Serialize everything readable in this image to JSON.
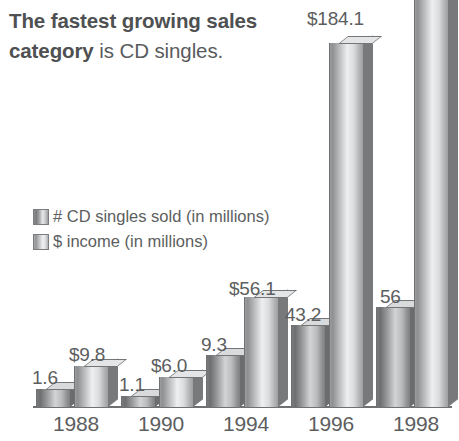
{
  "headline": {
    "strong": "The fastest growing sales category",
    "normal": " is CD singles."
  },
  "legend": {
    "items": [
      {
        "label": "# CD singles sold (in millions)",
        "swatch": "series-a"
      },
      {
        "label": "$ income (in millions)",
        "swatch": "series-b"
      }
    ]
  },
  "chart_data": {
    "type": "bar",
    "title": "The fastest growing sales category is CD singles.",
    "xlabel": "",
    "ylabel": "",
    "grid": false,
    "legend_position": "upper-left",
    "note": "1998 $ income bar is clipped at the top of the image and carries no printed value label.",
    "categories": [
      "1988",
      "1990",
      "1994",
      "1996",
      "1998"
    ],
    "series": [
      {
        "name": "# CD singles sold (in millions)",
        "key": "series-a",
        "values": [
          1.6,
          1.1,
          9.3,
          43.2,
          56
        ],
        "labels": [
          "1.6",
          "1.1",
          "9.3",
          "43.2",
          "56"
        ]
      },
      {
        "name": "$ income (in millions)",
        "key": "series-b",
        "values": [
          9.8,
          6.0,
          56.1,
          184.1,
          null
        ],
        "labels": [
          "$9.8",
          "$6.0",
          "$56.1",
          "$184.1",
          ""
        ]
      }
    ]
  },
  "colors": {
    "text": "#5c5e60",
    "axis": "#6e7072",
    "bar_dark": "#6d6f71",
    "bar_light": "#eeeff0",
    "background": "#ffffff"
  },
  "bars": [
    {
      "name": "bar-1988-singles",
      "series": "series-a",
      "left": 36,
      "width": 34,
      "height": 18,
      "label": "1.6",
      "label_left": 32,
      "label_top": 367
    },
    {
      "name": "bar-1988-income",
      "series": "series-b",
      "left": 74,
      "width": 34,
      "height": 41,
      "label": "$9.8",
      "label_left": 69,
      "label_top": 344
    },
    {
      "name": "bar-1990-singles",
      "series": "series-a",
      "left": 121,
      "width": 34,
      "height": 11,
      "label": "1.1",
      "label_left": 119,
      "label_top": 374
    },
    {
      "name": "bar-1990-income",
      "series": "series-b",
      "left": 159,
      "width": 34,
      "height": 30,
      "label": "$6.0",
      "label_left": 151,
      "label_top": 355
    },
    {
      "name": "bar-1994-singles",
      "series": "series-a",
      "left": 206,
      "width": 34,
      "height": 52,
      "label": "9.3",
      "label_left": 201,
      "label_top": 334
    },
    {
      "name": "bar-1994-income",
      "series": "series-b",
      "left": 244,
      "width": 34,
      "height": 110,
      "label": "$56.1",
      "label_left": 229,
      "label_top": 278
    },
    {
      "name": "bar-1996-singles",
      "series": "series-a",
      "left": 291,
      "width": 34,
      "height": 82,
      "label": "43.2",
      "label_left": 285,
      "label_top": 304
    },
    {
      "name": "bar-1996-income",
      "series": "series-b",
      "left": 329,
      "width": 34,
      "height": 364,
      "label": "$184.1",
      "label_left": 307,
      "label_top": 8
    },
    {
      "name": "bar-1998-singles",
      "series": "series-a",
      "left": 376,
      "width": 34,
      "height": 100,
      "label": "56",
      "label_left": 380,
      "label_top": 286
    },
    {
      "name": "bar-1998-income",
      "series": "series-b",
      "left": 414,
      "width": 34,
      "height": 412,
      "label": "",
      "label_left": 0,
      "label_top": 0
    }
  ],
  "years": [
    {
      "label": "1988",
      "left": 33,
      "width": 86
    },
    {
      "label": "1990",
      "left": 118,
      "width": 86
    },
    {
      "label": "1994",
      "left": 203,
      "width": 86
    },
    {
      "label": "1996",
      "left": 288,
      "width": 86
    },
    {
      "label": "1998",
      "left": 373,
      "width": 86
    }
  ]
}
